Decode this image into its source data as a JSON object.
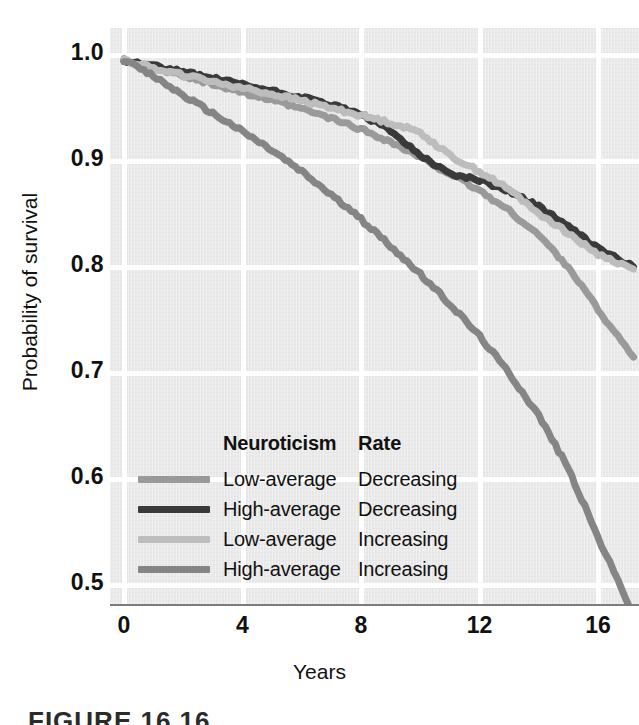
{
  "figure": {
    "caption": "FIGURE 16.16"
  },
  "axes": {
    "y_title": "Probability of survival",
    "x_title": "Years",
    "y_ticks": [
      "1.0",
      "0.9",
      "0.8",
      "0.7",
      "0.6",
      "0.5"
    ],
    "x_ticks": [
      "0",
      "4",
      "8",
      "12",
      "16"
    ],
    "axis_break_icon": "axis-break-zigzag"
  },
  "legend": {
    "header_neuroticism": "Neuroticism",
    "header_rate": "Rate",
    "rows": [
      {
        "neuroticism": "Low-average",
        "rate": "Decreasing",
        "color": "#9a9a9a"
      },
      {
        "neuroticism": "High-average",
        "rate": "Decreasing",
        "color": "#3a3a3a"
      },
      {
        "neuroticism": "Low-average",
        "rate": "Increasing",
        "color": "#bdbdbd"
      },
      {
        "neuroticism": "High-average",
        "rate": "Increasing",
        "color": "#858585"
      }
    ]
  },
  "colors": {
    "plot_background": "#e9e9e9",
    "gridline": "#ffffff",
    "axis": "#7b7b7b",
    "text": "#111111"
  },
  "chart_data": {
    "type": "line",
    "title": "",
    "subtitle": "",
    "xlabel": "Years",
    "ylabel": "Probability of survival",
    "xlim": [
      0,
      17.3
    ],
    "ylim": [
      0.46,
      1.0
    ],
    "y_axis_broken": true,
    "grid": true,
    "legend_position": "inside-lower-left",
    "x_ticks": [
      0,
      4,
      8,
      12,
      16
    ],
    "y_ticks": [
      0.5,
      0.6,
      0.7,
      0.8,
      0.9,
      1.0
    ],
    "series": [
      {
        "name": "Low-average Neuroticism, Decreasing Rate",
        "neuroticism": "Low-average",
        "rate": "Decreasing",
        "color": "#9a9a9a",
        "x": [
          0,
          1,
          2,
          3,
          4,
          5,
          6,
          7,
          8,
          9,
          10,
          11,
          12,
          13,
          14,
          15,
          16,
          17.2
        ],
        "y": [
          0.995,
          0.988,
          0.98,
          0.973,
          0.965,
          0.957,
          0.949,
          0.94,
          0.93,
          0.918,
          0.903,
          0.888,
          0.872,
          0.853,
          0.83,
          0.8,
          0.76,
          0.715
        ]
      },
      {
        "name": "High-average Neuroticism, Decreasing Rate",
        "neuroticism": "High-average",
        "rate": "Decreasing",
        "color": "#3a3a3a",
        "x": [
          0,
          1,
          2,
          3,
          4,
          5,
          6,
          7,
          8,
          9,
          10,
          11,
          12,
          13,
          14,
          15,
          16,
          17.2
        ],
        "y": [
          0.995,
          0.99,
          0.984,
          0.978,
          0.972,
          0.966,
          0.96,
          0.953,
          0.944,
          0.928,
          0.906,
          0.888,
          0.882,
          0.872,
          0.857,
          0.838,
          0.818,
          0.8
        ]
      },
      {
        "name": "Low-average Neuroticism, Increasing Rate",
        "neuroticism": "Low-average",
        "rate": "Increasing",
        "color": "#bdbdbd",
        "x": [
          0,
          1,
          2,
          3,
          4,
          5,
          6,
          7,
          8,
          9,
          10,
          11,
          12,
          13,
          14,
          15,
          16,
          17.2
        ],
        "y": [
          0.995,
          0.988,
          0.981,
          0.975,
          0.969,
          0.963,
          0.957,
          0.95,
          0.943,
          0.936,
          0.927,
          0.905,
          0.89,
          0.873,
          0.851,
          0.832,
          0.812,
          0.798
        ]
      },
      {
        "name": "High-average Neuroticism, Increasing Rate",
        "neuroticism": "High-average",
        "rate": "Increasing",
        "color": "#858585",
        "x": [
          0,
          1,
          2,
          3,
          4,
          5,
          6,
          7,
          8,
          9,
          10,
          11,
          12,
          13,
          14,
          15,
          16,
          17.2
        ],
        "y": [
          0.995,
          0.98,
          0.962,
          0.945,
          0.928,
          0.91,
          0.89,
          0.868,
          0.845,
          0.82,
          0.793,
          0.765,
          0.735,
          0.7,
          0.66,
          0.61,
          0.545,
          0.472
        ]
      }
    ]
  }
}
